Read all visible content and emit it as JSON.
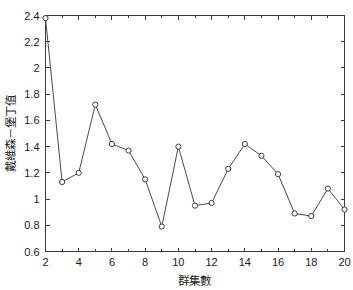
{
  "chart_data": {
    "type": "line",
    "title": "",
    "subtitle": "",
    "xlabel": "群集數",
    "ylabel": "戴維森－堡丁值",
    "xlim": [
      2,
      20
    ],
    "ylim": [
      0.6,
      2.4
    ],
    "grid": false,
    "legend": null,
    "legend_position": "none",
    "marker": "circle-open",
    "line_color": "#4b4b4b",
    "marker_face_color": "#ffffff",
    "marker_edge_color": "#3c3c3c",
    "x": [
      2,
      3,
      4,
      5,
      6,
      7,
      8,
      9,
      10,
      11,
      12,
      13,
      14,
      15,
      16,
      17,
      18,
      19,
      20
    ],
    "values": [
      2.38,
      1.13,
      1.2,
      1.72,
      1.42,
      1.37,
      1.15,
      0.79,
      1.4,
      0.95,
      0.97,
      1.23,
      1.42,
      1.33,
      1.19,
      0.89,
      0.87,
      1.08,
      0.92
    ],
    "series": [
      {
        "name": "戴維森－堡丁值",
        "values": [
          2.38,
          1.13,
          1.2,
          1.72,
          1.42,
          1.37,
          1.15,
          0.79,
          1.4,
          0.95,
          0.97,
          1.23,
          1.42,
          1.33,
          1.19,
          0.89,
          0.87,
          1.08,
          0.92
        ]
      }
    ],
    "xticks": [
      2,
      4,
      6,
      8,
      10,
      12,
      14,
      16,
      18,
      20
    ],
    "xtick_labels": [
      "2",
      "4",
      "6",
      "8",
      "10",
      "12",
      "14",
      "16",
      "18",
      "20"
    ],
    "xminor_ticks": [
      3,
      5,
      7,
      9,
      11,
      13,
      15,
      17,
      19
    ],
    "yticks": [
      0.6,
      0.8,
      1.0,
      1.2,
      1.4,
      1.6,
      1.8,
      2.0,
      2.2,
      2.4
    ],
    "ytick_labels": [
      "0.6",
      "0.8",
      "1",
      "1.2",
      "1.4",
      "1.6",
      "1.8",
      "2",
      "2.2",
      "2.4"
    ]
  }
}
